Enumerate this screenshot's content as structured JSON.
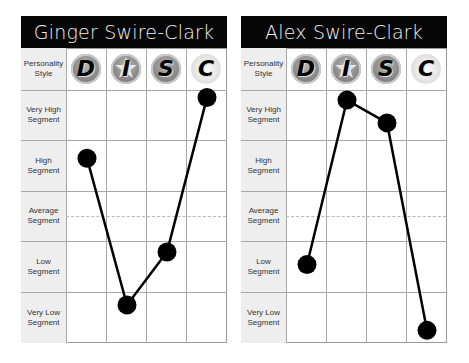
{
  "panels": [
    {
      "title": "Ginger Swire-Clark",
      "header_label": "Personality Style",
      "columns": [
        "D",
        "I",
        "S",
        "C"
      ],
      "rows": [
        "Very High Segment",
        "High Segment",
        "Average Segment",
        "Low Segment",
        "Very Low Segment"
      ]
    },
    {
      "title": "Alex Swire-Clark",
      "header_label": "Personality Style",
      "columns": [
        "D",
        "I",
        "S",
        "C"
      ],
      "rows": [
        "Very High Segment",
        "High Segment",
        "Average Segment",
        "Low Segment",
        "Very Low Segment"
      ]
    }
  ],
  "chart_data": [
    {
      "type": "line",
      "title": "Ginger Swire-Clark",
      "categories": [
        "D",
        "I",
        "S",
        "C"
      ],
      "ylabel": "Segment",
      "yticks": [
        "Very Low Segment",
        "Low Segment",
        "Average Segment",
        "High Segment",
        "Very High Segment"
      ],
      "ylim": [
        0,
        5
      ],
      "series": [
        {
          "name": "Ginger Swire-Clark",
          "values": [
            3.65,
            0.75,
            1.8,
            4.85
          ]
        }
      ],
      "grid": true,
      "marker_color": "#000000",
      "line_color": "#000000"
    },
    {
      "type": "line",
      "title": "Alex Swire-Clark",
      "categories": [
        "D",
        "I",
        "S",
        "C"
      ],
      "ylabel": "Segment",
      "yticks": [
        "Very Low Segment",
        "Low Segment",
        "Average Segment",
        "High Segment",
        "Very High Segment"
      ],
      "ylim": [
        0,
        5
      ],
      "series": [
        {
          "name": "Alex Swire-Clark",
          "values": [
            1.55,
            4.8,
            4.35,
            0.25
          ]
        }
      ],
      "grid": true,
      "marker_color": "#000000",
      "line_color": "#000000"
    }
  ]
}
